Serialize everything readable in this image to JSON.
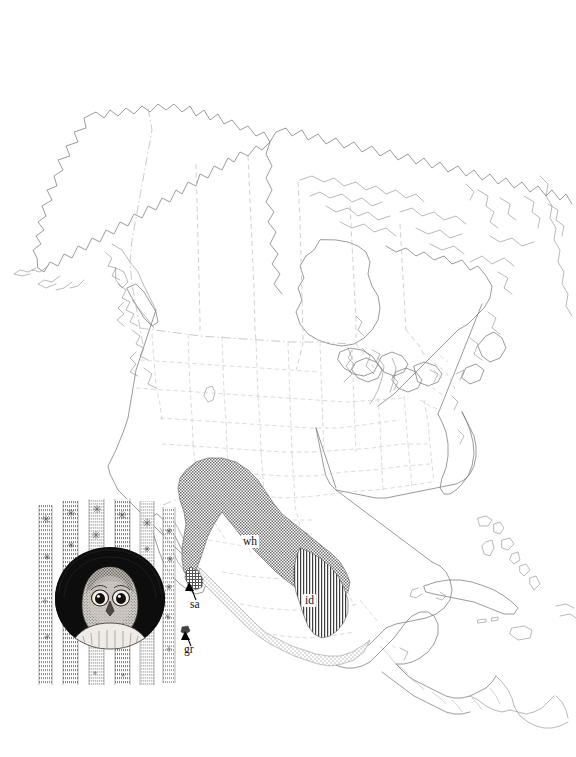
{
  "figure": {
    "type": "species-range-map",
    "domain": "Map",
    "region": "North America, Mexico and Central America",
    "background_color": "#ffffff",
    "line_color": "#7a7a7a",
    "border_color": "#c0c0c0"
  },
  "map": {
    "name": "north-america-basemap",
    "features": [
      "Alaska",
      "Canada",
      "Hudson Bay",
      "Arctic Archipelago",
      "Greenland edge",
      "Great Lakes",
      "Vancouver Island",
      "Contiguous United States",
      "Baja California",
      "Mexico",
      "Yucatan Peninsula",
      "Central America",
      "Florida",
      "Cuba",
      "Bahamas",
      "Jamaica",
      "Hispaniola edge",
      "Trinidad",
      "northern South America"
    ],
    "border_styles": {
      "international": "dash-dot",
      "state_province": "dashed",
      "coastline": "solid"
    }
  },
  "ranges": [
    {
      "code": "wh",
      "label": "wh",
      "pattern": "dark-stipple",
      "fill_tone": "#8d8d8d",
      "label_x": 248,
      "label_y": 543,
      "extent": "southwestern United States through northern and central Mexico"
    },
    {
      "code": "id",
      "label": "id",
      "pattern": "vertical-hatch",
      "fill_tone": "#4a4a4a",
      "label_x": 310,
      "label_y": 602,
      "extent": "eastern and southern Mexico"
    },
    {
      "code": "sa",
      "label": "sa",
      "pattern": "cross-hatch",
      "fill_tone": "#666666",
      "label_x": 194,
      "label_y": 606,
      "extent": "southern tip of Baja California",
      "has_leader_arrow": true
    },
    {
      "code": "gr",
      "label": "gr",
      "pattern": "solid-dot",
      "fill_tone": "#3b3b3b",
      "label_x": 188,
      "label_y": 652,
      "extent": "Socorro Island, Revillagigedo Islands",
      "has_leader_arrow": true
    },
    {
      "code": "coastal",
      "label": "",
      "pattern": "light-stipple",
      "fill_tone": "#d2d2d2",
      "extent": "Pacific coastal lowlands of Mexico"
    }
  ],
  "illustration": {
    "name": "elf-owl-in-cactus-cavity",
    "description": "pen and ink drawing of a small owl peering from a nest hole in a saguaro cactus",
    "x": 33,
    "y": 497,
    "width": 155,
    "height": 193
  }
}
